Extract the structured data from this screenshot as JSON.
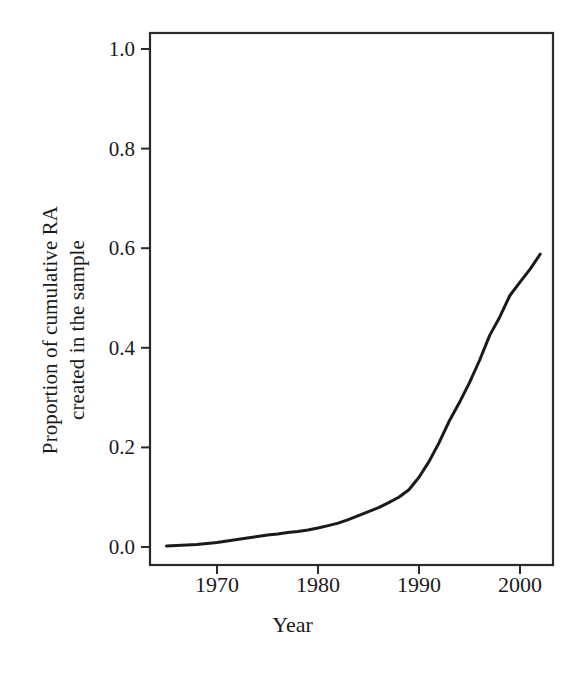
{
  "chart_data": {
    "type": "line",
    "title": "",
    "subtitle": "",
    "xlabel": "Year",
    "ylabel": "Proportion of cumulative RA created in the sample",
    "ylabel_lines": [
      "Proportion of cumulative RA",
      "created in the sample"
    ],
    "xlim": [
      1964.5,
      2002.5
    ],
    "ylim": [
      0.0,
      1.0
    ],
    "grid": false,
    "legend": "none",
    "xticks": [
      1970,
      1980,
      1990,
      2000
    ],
    "xtick_labels": [
      "1970",
      "1980",
      "1990",
      "2000"
    ],
    "yticks": [
      0.0,
      0.2,
      0.4,
      0.6,
      0.8,
      1.0
    ],
    "ytick_labels": [
      "0.0",
      "0.2",
      "0.4",
      "0.6",
      "0.8",
      "1.0"
    ],
    "series": [
      {
        "name": "Proportion of cumulative RA created in the sample",
        "color": "#1a1a1a",
        "line_width": 3,
        "x": [
          1965,
          1966,
          1967,
          1968,
          1969,
          1970,
          1971,
          1972,
          1973,
          1974,
          1975,
          1976,
          1977,
          1978,
          1979,
          1980,
          1981,
          1982,
          1983,
          1984,
          1985,
          1986,
          1987,
          1988,
          1989,
          1990,
          1991,
          1992,
          1993,
          1994,
          1995,
          1996,
          1997,
          1998,
          1999,
          2000,
          2001,
          2002
        ],
        "values": [
          0.002,
          0.003,
          0.004,
          0.005,
          0.007,
          0.009,
          0.012,
          0.015,
          0.018,
          0.021,
          0.024,
          0.026,
          0.029,
          0.031,
          0.034,
          0.038,
          0.043,
          0.048,
          0.055,
          0.063,
          0.071,
          0.079,
          0.089,
          0.1,
          0.115,
          0.14,
          0.172,
          0.21,
          0.253,
          0.29,
          0.33,
          0.375,
          0.425,
          0.462,
          0.505,
          0.532,
          0.558,
          0.588
        ]
      }
    ]
  },
  "axes": {
    "x_title": "Year",
    "y_title_line1": "Proportion of cumulative RA",
    "y_title_line2": "created in the sample",
    "frame_color": "#2b2b2b"
  }
}
